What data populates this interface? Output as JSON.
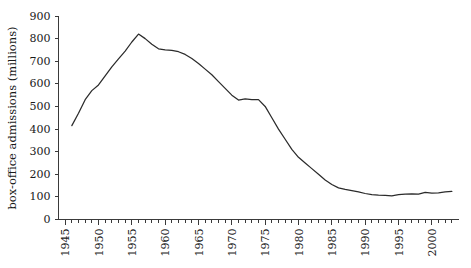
{
  "chart_data": {
    "type": "line",
    "title": "",
    "subtitle": "",
    "xlabel": "",
    "ylabel": "box-office admissions (millions)",
    "xlim": [
      1944,
      2004
    ],
    "ylim": [
      0,
      900
    ],
    "grid": false,
    "legend": null,
    "y_ticks": [
      0,
      100,
      200,
      300,
      400,
      500,
      600,
      700,
      800,
      900
    ],
    "y_tick_labels": [
      "0",
      "100",
      "200",
      "300",
      "400",
      "500",
      "600",
      "700",
      "800",
      "900"
    ],
    "x_ticks": [
      1945,
      1950,
      1955,
      1960,
      1965,
      1970,
      1975,
      1980,
      1985,
      1990,
      1995,
      2000
    ],
    "x_tick_labels": [
      "1945",
      "1950",
      "1955",
      "1960",
      "1965",
      "1970",
      "1975",
      "1980",
      "1985",
      "1990",
      "1995",
      "2000"
    ],
    "x_minor_tick_step": 1,
    "x_tick_label_rotation": 90,
    "series": [
      {
        "name": "box-office admissions",
        "color": "#2b2b2b",
        "x": [
          1946,
          1947,
          1948,
          1949,
          1950,
          1951,
          1952,
          1953,
          1954,
          1955,
          1956,
          1957,
          1958,
          1959,
          1960,
          1961,
          1962,
          1963,
          1964,
          1965,
          1966,
          1967,
          1968,
          1969,
          1970,
          1971,
          1972,
          1973,
          1974,
          1975,
          1976,
          1977,
          1978,
          1979,
          1980,
          1981,
          1982,
          1983,
          1984,
          1985,
          1986,
          1987,
          1988,
          1989,
          1990,
          1991,
          1992,
          1993,
          1994,
          1995,
          1996,
          1997,
          1998,
          1999,
          2000,
          2001,
          2002,
          2003
        ],
        "values": [
          415,
          470,
          530,
          570,
          595,
          635,
          675,
          710,
          745,
          785,
          820,
          800,
          775,
          755,
          750,
          748,
          742,
          730,
          712,
          690,
          665,
          640,
          610,
          580,
          550,
          528,
          533,
          530,
          530,
          500,
          450,
          400,
          355,
          310,
          275,
          250,
          225,
          200,
          175,
          155,
          140,
          133,
          128,
          122,
          115,
          110,
          108,
          107,
          105,
          110,
          112,
          113,
          112,
          120,
          117,
          118,
          122,
          124
        ]
      }
    ],
    "annotations": []
  },
  "figure": {
    "background_color": "#ffffff",
    "line_color": "#2b2b2b",
    "axis_color": "#3a3a3a"
  }
}
